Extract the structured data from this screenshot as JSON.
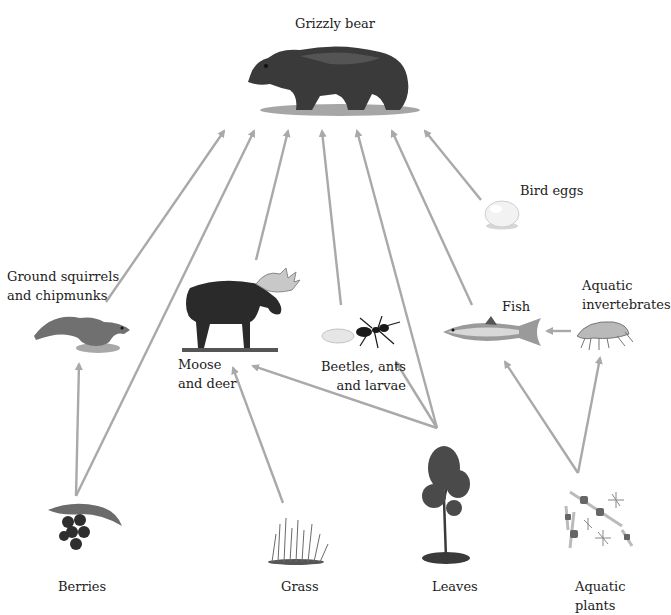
{
  "header": {
    "title_partial": ""
  },
  "diagram": {
    "type": "food web",
    "arrow_color": "#a9a9a9",
    "nodes": {
      "grizzly_bear": {
        "label": "Grizzly bear"
      },
      "bird_eggs": {
        "label": "Bird eggs"
      },
      "ground_squirrels": {
        "label_line1": "Ground squirrels",
        "label_line2": "and chipmunks"
      },
      "moose": {
        "label_line1": "Moose",
        "label_line2": "and deer"
      },
      "beetles": {
        "label_line1": "Beetles, ants",
        "label_line2": "and larvae"
      },
      "fish": {
        "label": "Fish"
      },
      "aquatic_invertebrates": {
        "label_line1": "Aquatic",
        "label_line2": "invertebrates"
      },
      "berries": {
        "label": "Berries"
      },
      "grass": {
        "label": "Grass"
      },
      "leaves": {
        "label": "Leaves"
      },
      "aquatic_plants": {
        "label_line1": "Aquatic",
        "label_line2": "plants"
      }
    },
    "edges": [
      {
        "from": "Ground squirrels and chipmunks",
        "to": "Grizzly bear"
      },
      {
        "from": "Berries",
        "to": "Grizzly bear"
      },
      {
        "from": "Moose and deer",
        "to": "Grizzly bear"
      },
      {
        "from": "Beetles, ants and larvae",
        "to": "Grizzly bear"
      },
      {
        "from": "Leaves",
        "to": "Grizzly bear"
      },
      {
        "from": "Fish",
        "to": "Grizzly bear"
      },
      {
        "from": "Bird eggs",
        "to": "Grizzly bear"
      },
      {
        "from": "Berries",
        "to": "Ground squirrels and chipmunks"
      },
      {
        "from": "Grass",
        "to": "Moose and deer"
      },
      {
        "from": "Leaves",
        "to": "Moose and deer"
      },
      {
        "from": "Leaves",
        "to": "Beetles, ants and larvae"
      },
      {
        "from": "Aquatic invertebrates",
        "to": "Fish"
      },
      {
        "from": "Aquatic plants",
        "to": "Fish"
      },
      {
        "from": "Aquatic plants",
        "to": "Aquatic invertebrates"
      }
    ]
  }
}
